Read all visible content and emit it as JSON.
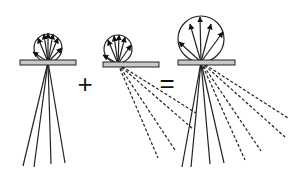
{
  "diagram": {
    "colors": {
      "stroke": "#222222",
      "plate_fill": "#c8c8c8",
      "background": "#ffffff"
    },
    "operators": {
      "plus": "+",
      "equals": "="
    },
    "panels": [
      {
        "name": "reflection-only",
        "plate": {
          "x": 20,
          "y": 60,
          "w": 56,
          "h": 5
        },
        "origin": [
          48,
          62
        ],
        "circle": {
          "cx": 48,
          "cy": 48,
          "r": 14
        },
        "reflected_arrows": [
          [
            33,
            52
          ],
          [
            38,
            38
          ],
          [
            44,
            34
          ],
          [
            48,
            33
          ],
          [
            53,
            34
          ],
          [
            58,
            38
          ],
          [
            62,
            48
          ]
        ],
        "transmitted_rays_solid": [
          [
            23,
            166
          ],
          [
            34,
            167
          ],
          [
            51,
            164
          ],
          [
            65,
            163
          ]
        ],
        "transmitted_rays_dashed": []
      },
      {
        "name": "diffuse-transmission",
        "plate": {
          "x": 103,
          "y": 62,
          "w": 56,
          "h": 5
        },
        "origin": [
          118,
          64
        ],
        "circle": {
          "cx": 118,
          "cy": 49,
          "r": 14
        },
        "reflected_arrows": [
          [
            103,
            55
          ],
          [
            108,
            40
          ],
          [
            114,
            36
          ],
          [
            119,
            35
          ],
          [
            125,
            37
          ],
          [
            131,
            45
          ]
        ],
        "transmitted_rays_solid": [],
        "transmitted_rays_dashed": [
          [
            158,
            158
          ],
          [
            175,
            150
          ],
          [
            193,
            129
          ],
          [
            196,
            113
          ]
        ]
      },
      {
        "name": "combined",
        "plate": {
          "x": 178,
          "y": 60,
          "w": 57,
          "h": 5
        },
        "origin": [
          201,
          62
        ],
        "circle": {
          "cx": 201,
          "cy": 39,
          "r": 23
        },
        "reflected_arrows": [
          [
            179,
            42
          ],
          [
            190,
            24
          ],
          [
            200,
            17
          ],
          [
            211,
            24
          ],
          [
            223,
            32
          ]
        ],
        "transmitted_rays_solid": [
          [
            182,
            167
          ],
          [
            191,
            167
          ],
          [
            210,
            164
          ],
          [
            224,
            163
          ]
        ],
        "transmitted_rays_dashed": [
          [
            245,
            160
          ],
          [
            261,
            151
          ],
          [
            285,
            137
          ],
          [
            288,
            118
          ]
        ]
      }
    ]
  }
}
